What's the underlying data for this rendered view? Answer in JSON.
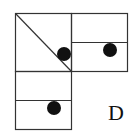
{
  "figure": {
    "option_label": "D",
    "stroke_color": "#333333",
    "fill_color": "#111111",
    "panels": [
      {
        "name": "top-left",
        "has_diagonal": true,
        "dots": 1
      },
      {
        "name": "top-right",
        "divided_horizontally": true,
        "dots": 1
      },
      {
        "name": "bottom-left",
        "divided_horizontally": true,
        "dots": 1
      }
    ]
  }
}
